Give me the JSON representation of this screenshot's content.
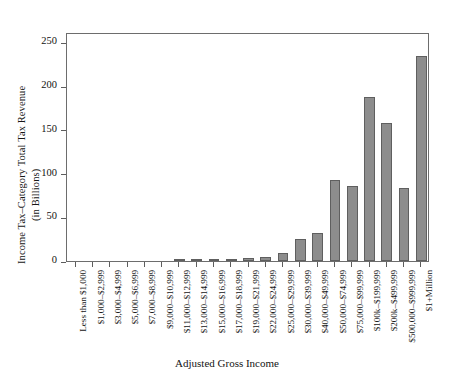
{
  "chart_data": {
    "type": "bar",
    "title": "",
    "xlabel": "Adjusted Gross Income",
    "ylabel": "Income Tax–Category Total Tax Revenue (in Billions)",
    "ylabel_line1": "Income Tax–Category Total Tax Revenue",
    "ylabel_line2": "(in Billions)",
    "ylim": [
      0,
      262
    ],
    "yticks": [
      0,
      50,
      100,
      150,
      200,
      250
    ],
    "ytick_labels": [
      "0",
      "50",
      "100",
      "150",
      "200",
      "250"
    ],
    "grid": false,
    "legend": null,
    "bar_color": "#8d8d8d",
    "bar_edge_color": "#5f5f5f",
    "axis_color": "#6d6d6d",
    "categories": [
      "Less than $1,000",
      "$1,000–$2,999",
      "$3,000–$4,999",
      "$5,000–$6,999",
      "$7,000–$8,999",
      "$9,000–$10,999",
      "$11,000–$12,999",
      "$13,000–$14,999",
      "$15,000–$16,999",
      "$17,000–$18,999",
      "$19,000–$21,999",
      "$22,000–$24,999",
      "$25,000–$29,999",
      "$30,000–$39,999",
      "$40,000–$49,999",
      "$50,000–$74,999",
      "$75,000–$99,999",
      "$100k–$199,999",
      "$200k–$499,999",
      "$500,000–$999,999",
      "$1+Million"
    ],
    "values": [
      0,
      0,
      0,
      0,
      0,
      0.4,
      0.7,
      1.1,
      1.6,
      2.2,
      3.2,
      4.3,
      9.5,
      25,
      32,
      93,
      86,
      188,
      158,
      84,
      235
    ]
  }
}
